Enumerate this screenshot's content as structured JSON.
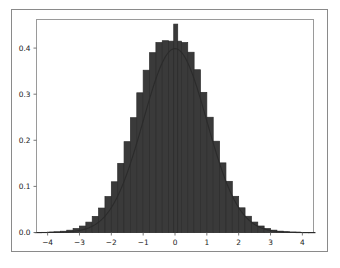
{
  "figure": {
    "background_color": "#ffffff",
    "border_color": "#8a8a8a",
    "axes_frame_color": "#9a9a9a"
  },
  "chart_data": {
    "type": "bar",
    "title": "",
    "subtitle": "",
    "xlabel": "",
    "ylabel": "",
    "xlim": [
      -4.35,
      4.35
    ],
    "ylim": [
      0.0,
      0.462
    ],
    "grid": false,
    "legend": null,
    "legend_position": "none",
    "bar_color": "#3a3a3a",
    "bar_edge_color": "#2b2b2b",
    "curve_color": "#2b2b2b",
    "xticks": [
      -4,
      -3,
      -2,
      -1,
      0,
      1,
      2,
      3,
      4
    ],
    "xtick_labels": [
      "−4",
      "−3",
      "−2",
      "−1",
      "0",
      "1",
      "2",
      "3",
      "4"
    ],
    "yticks": [
      0.0,
      0.1,
      0.2,
      0.3,
      0.4
    ],
    "ytick_labels": [
      "0.0",
      "0.1",
      "0.2",
      "0.3",
      "0.4"
    ],
    "bin_width": 0.2,
    "bin_centers": [
      -4.3,
      -4.1,
      -3.9,
      -3.7,
      -3.5,
      -3.3,
      -3.1,
      -2.9,
      -2.7,
      -2.5,
      -2.3,
      -2.1,
      -1.9,
      -1.7,
      -1.5,
      -1.3,
      -1.1,
      -0.9,
      -0.7,
      -0.5,
      -0.3,
      -0.1,
      0.1,
      0.3,
      0.5,
      0.7,
      0.9,
      1.1,
      1.3,
      1.5,
      1.7,
      1.9,
      2.1,
      2.3,
      2.5,
      2.7,
      2.9,
      3.1,
      3.3,
      3.5,
      3.7,
      3.9,
      4.1,
      4.3
    ],
    "bin_heights": [
      0.0002,
      0.0004,
      0.0008,
      0.0015,
      0.0028,
      0.005,
      0.0085,
      0.014,
      0.0225,
      0.035,
      0.053,
      0.078,
      0.11,
      0.15,
      0.197,
      0.249,
      0.303,
      0.352,
      0.39,
      0.412,
      0.416,
      0.415,
      0.415,
      0.412,
      0.391,
      0.353,
      0.304,
      0.25,
      0.198,
      0.151,
      0.111,
      0.0785,
      0.0535,
      0.0352,
      0.0226,
      0.0141,
      0.0086,
      0.0051,
      0.0029,
      0.0016,
      0.0008,
      0.0004,
      0.0002,
      0.0001
    ],
    "spike": {
      "x": 0.0,
      "height": 0.452,
      "width": 0.08
    },
    "curve": {
      "name": "normal-pdf",
      "mu": 0,
      "sigma": 1,
      "peak": 0.3989
    }
  }
}
